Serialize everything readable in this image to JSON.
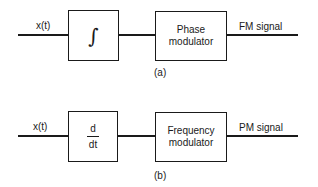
{
  "diagram_a": {
    "input_label": "x(t)",
    "block1": {
      "symbol": "∫",
      "type": "integrator"
    },
    "block2": {
      "line1": "Phase",
      "line2": "modulator"
    },
    "output_label": "FM signal",
    "caption": "(a)"
  },
  "diagram_b": {
    "input_label": "x(t)",
    "block1": {
      "numerator": "d",
      "denominator": "dt",
      "type": "differentiator"
    },
    "block2": {
      "line1": "Frequency",
      "line2": "modulator"
    },
    "output_label": "PM signal",
    "caption": "(b)"
  }
}
